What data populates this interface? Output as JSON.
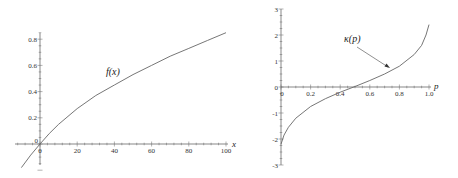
{
  "chart_data": [
    {
      "type": "line",
      "title": "",
      "annotation": "f(x)",
      "xlabel": "x",
      "ylabel": "",
      "xlim": [
        -12,
        100
      ],
      "ylim": [
        -0.2,
        0.85
      ],
      "x_ticks": [
        "0",
        "20",
        "40",
        "60",
        "80",
        "100"
      ],
      "y_ticks": [
        "0",
        "0.2",
        "0.4",
        "0.6",
        "0.8"
      ],
      "grid": false,
      "series": [
        {
          "name": "f(x)",
          "x": [
            -10,
            -5,
            0,
            5,
            10,
            20,
            30,
            40,
            50,
            60,
            70,
            80,
            90,
            100
          ],
          "y": [
            -0.18,
            -0.085,
            0.0,
            0.08,
            0.15,
            0.27,
            0.37,
            0.45,
            0.53,
            0.6,
            0.67,
            0.73,
            0.79,
            0.85
          ]
        }
      ]
    },
    {
      "type": "line",
      "title": "",
      "annotation": "κ(p)",
      "xlabel": "p",
      "ylabel": "",
      "xlim": [
        0,
        1.0
      ],
      "ylim": [
        -3,
        3
      ],
      "x_ticks": [
        "0",
        "0.2",
        "0.4",
        "0.6",
        "0.8",
        "1.0"
      ],
      "y_ticks": [
        "-3",
        "-2",
        "-1",
        "0",
        "1",
        "2",
        "3"
      ],
      "grid": false,
      "series": [
        {
          "name": "κ(p)",
          "x": [
            0.0,
            0.02,
            0.05,
            0.1,
            0.2,
            0.3,
            0.4,
            0.5,
            0.6,
            0.7,
            0.8,
            0.9,
            0.95,
            0.98,
            1.0
          ],
          "y": [
            -2.2,
            -1.85,
            -1.55,
            -1.2,
            -0.75,
            -0.45,
            -0.2,
            0.02,
            0.25,
            0.5,
            0.8,
            1.25,
            1.6,
            2.0,
            2.4
          ]
        }
      ]
    }
  ]
}
